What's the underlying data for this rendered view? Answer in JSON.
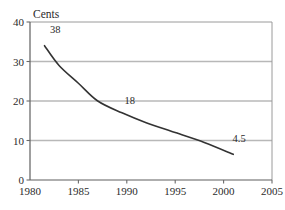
{
  "chart_data": {
    "type": "line",
    "title": "",
    "subtitle": "",
    "xlabel": "",
    "ylabel": "Cents",
    "xlim": [
      1980,
      2005
    ],
    "ylim": [
      0,
      40
    ],
    "grid": true,
    "grid_axis": "y",
    "legend": false,
    "legend_position": "none",
    "x_ticks": [
      1980,
      1985,
      1990,
      1995,
      2000,
      2005
    ],
    "x_tick_labels": [
      "1980",
      "1985",
      "1990",
      "1995",
      "2000",
      "2005"
    ],
    "y_ticks": [
      0,
      10,
      20,
      30,
      40
    ],
    "y_tick_labels": [
      "0",
      "10",
      "20",
      "30",
      "40"
    ],
    "series": [
      {
        "name": "Cents",
        "color": "#333333",
        "x": [
          1981.5,
          1983,
          1985,
          1987,
          1989.5,
          1992,
          1995,
          1998,
          2001
        ],
        "values": [
          34.0,
          29.0,
          24.5,
          20.0,
          17.0,
          14.5,
          12.0,
          9.5,
          6.5
        ]
      }
    ],
    "annotations": [
      {
        "text": "38",
        "x": 1982.6,
        "y": 37.2
      },
      {
        "text": "18",
        "x": 1990.3,
        "y": 19.3
      },
      {
        "text": "4.5",
        "x": 2001.6,
        "y": 9.6
      }
    ],
    "colors": {
      "curve": "#333333",
      "gridline": "#b8b8b8",
      "axis": "#6a6a6a",
      "text": "#2b2b2b",
      "background": "#ffffff"
    }
  }
}
